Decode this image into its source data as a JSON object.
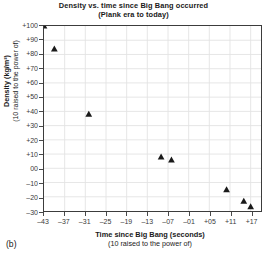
{
  "figure": {
    "caption": "(b)"
  },
  "chart_data": {
    "type": "scatter",
    "title": "Density vs. time since Big Bang occurred",
    "subtitle": "(Plank era to today)",
    "xlabel": "Time since Big Bang (seconds)",
    "xlabel_sub": "(10 raised to the power of)",
    "ylabel": "Density (kg/m³)",
    "ylabel_sub": "(10 raised to the power of)",
    "xlim": [
      -43,
      20
    ],
    "ylim": [
      -30,
      100
    ],
    "xticks": [
      -43,
      -37,
      -31,
      -25,
      -19,
      -13,
      -7,
      -1,
      5,
      11,
      17
    ],
    "xtick_labels": [
      "–43",
      "–37",
      "–31",
      "–25",
      "–19",
      "–13",
      "–07",
      "–01",
      "+05",
      "+11",
      "+17"
    ],
    "yticks": [
      100,
      90,
      80,
      70,
      60,
      50,
      40,
      30,
      20,
      10,
      0,
      -10,
      -20,
      -30
    ],
    "ytick_labels": [
      "+100",
      "+90",
      "+80",
      "+70",
      "+60",
      "+50",
      "+40",
      "+30",
      "+20",
      "+10",
      "00",
      "–10",
      "–20",
      "–30"
    ],
    "grid": true,
    "grid_color": "#e3e3e3",
    "legend": null,
    "marker": "triangle",
    "marker_color": "#1a1a1a",
    "x": [
      -43,
      -40,
      -30,
      -9,
      -6,
      10,
      15,
      17
    ],
    "y": [
      100,
      84,
      38,
      8,
      6,
      -15,
      -23,
      -27
    ],
    "points": [
      {
        "x": -43,
        "y": 100
      },
      {
        "x": -40,
        "y": 84
      },
      {
        "x": -30,
        "y": 38
      },
      {
        "x": -9,
        "y": 8
      },
      {
        "x": -6,
        "y": 6
      },
      {
        "x": 10,
        "y": -15
      },
      {
        "x": 15,
        "y": -23
      },
      {
        "x": 17,
        "y": -27
      }
    ]
  }
}
